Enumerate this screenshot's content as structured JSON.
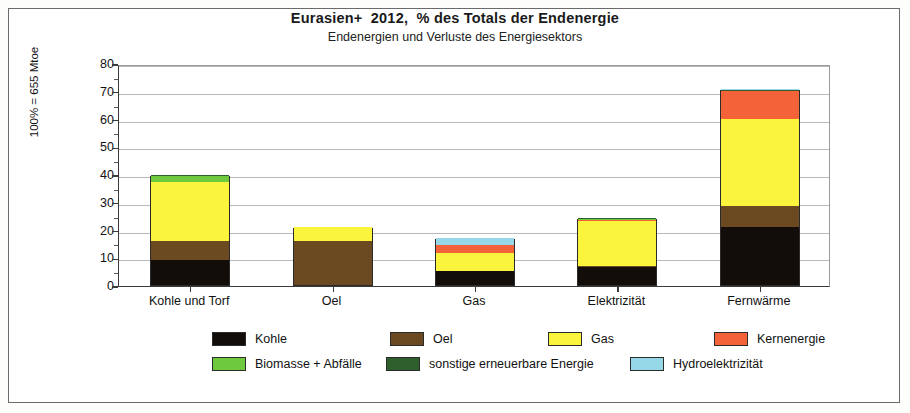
{
  "chart_data": {
    "type": "bar",
    "stacked": true,
    "title": "Eurasien+  2012,  % des Totals der Endenergie",
    "subtitle": "Endenergien und Verluste des Energiesektors",
    "xlabel": "",
    "ylabel": "100% = 655 Mtoe",
    "ylim": [
      0,
      80
    ],
    "yticks": [
      0,
      10,
      20,
      30,
      40,
      50,
      60,
      70,
      80
    ],
    "ytick_labels": [
      "0",
      "10",
      "20",
      "30",
      "40",
      "50",
      "60",
      "70",
      "80"
    ],
    "minor_ytick_step": 5,
    "grid": true,
    "legend_position": "bottom",
    "categories": [
      "Kohle und Torf",
      "Oel",
      "Gas",
      "Elektrizität",
      "Fernwärme"
    ],
    "series": [
      {
        "name": "Kohle",
        "color": "#120d09",
        "values": [
          9.0,
          0.0,
          5.0,
          6.5,
          21.0
        ]
      },
      {
        "name": "Oel",
        "color": "#6b4a22",
        "values": [
          6.7,
          15.8,
          0.0,
          0.5,
          7.5
        ]
      },
      {
        "name": "Gas",
        "color": "#fbf43c",
        "values": [
          21.4,
          5.1,
          6.5,
          16.3,
          31.5
        ]
      },
      {
        "name": "Kernenergie",
        "color": "#f4623a",
        "values": [
          0.0,
          0.0,
          3.0,
          0.2,
          10.0
        ]
      },
      {
        "name": "Biomasse + Abfälle",
        "color": "#6fc93f",
        "values": [
          2.1,
          0.0,
          0.0,
          0.2,
          0.0
        ]
      },
      {
        "name": "sonstige erneuerbare Energie",
        "color": "#2e5f2c",
        "values": [
          0.3,
          0.0,
          0.0,
          0.6,
          0.1
        ]
      },
      {
        "name": "Hydroelektrizität",
        "color": "#96d7e8",
        "values": [
          0.0,
          0.0,
          2.5,
          0.0,
          0.7
        ]
      }
    ],
    "totals": [
      39.5,
      20.9,
      17.0,
      24.3,
      70.8
    ]
  },
  "legend": {
    "rows": [
      [
        {
          "label": "Kohle",
          "color": "#120d09"
        },
        {
          "label": "Oel",
          "color": "#6b4a22"
        },
        {
          "label": "Gas",
          "color": "#fbf43c"
        },
        {
          "label": "Kernenergie",
          "color": "#f4623a"
        }
      ],
      [
        {
          "label": "Biomasse + Abfälle",
          "color": "#6fc93f"
        },
        {
          "label": "sonstige erneuerbare Energie",
          "color": "#2e5f2c"
        },
        {
          "label": "Hydroelektrizität",
          "color": "#96d7e8"
        }
      ]
    ]
  }
}
